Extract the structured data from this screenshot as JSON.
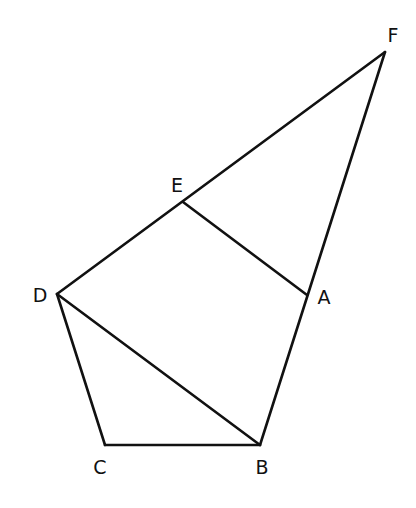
{
  "diagram": {
    "type": "geometry",
    "stroke_color": "#111111",
    "background": "#ffffff",
    "points": [
      {
        "id": "F",
        "label": "F",
        "x": 385,
        "y": 52,
        "lx": 393,
        "ly": 35
      },
      {
        "id": "E",
        "label": "E",
        "x": 183,
        "y": 202,
        "lx": 177,
        "ly": 185
      },
      {
        "id": "D",
        "label": "D",
        "x": 57,
        "y": 294,
        "lx": 40,
        "ly": 295
      },
      {
        "id": "A",
        "label": "A",
        "x": 307,
        "y": 295,
        "lx": 324,
        "ly": 297
      },
      {
        "id": "C",
        "label": "C",
        "x": 105,
        "y": 445,
        "lx": 100,
        "ly": 467
      },
      {
        "id": "B",
        "label": "B",
        "x": 260,
        "y": 445,
        "lx": 262,
        "ly": 467
      }
    ],
    "segments": [
      [
        "D",
        "F"
      ],
      [
        "F",
        "B"
      ],
      [
        "E",
        "A"
      ],
      [
        "D",
        "B"
      ],
      [
        "D",
        "C"
      ],
      [
        "C",
        "B"
      ]
    ]
  }
}
